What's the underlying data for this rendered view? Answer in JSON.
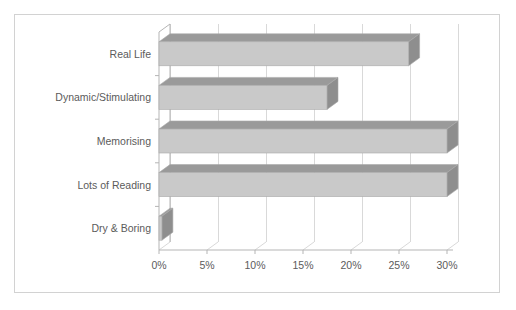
{
  "chart_data": {
    "type": "bar",
    "orientation": "horizontal",
    "style": "3d",
    "title": "",
    "subtitle": "",
    "xlabel": "",
    "ylabel": "",
    "categories": [
      "Dry & Boring",
      "Lots of Reading",
      "Memorising",
      "Dynamic/Stimulating",
      "Real Life"
    ],
    "values": [
      0.3,
      30,
      30,
      17.5,
      26
    ],
    "value_format": "percent",
    "xlim": [
      0,
      30
    ],
    "xticks": [
      0,
      5,
      10,
      15,
      20,
      25,
      30
    ],
    "xtick_labels": [
      "0%",
      "5%",
      "10%",
      "15%",
      "20%",
      "25%",
      "30%"
    ],
    "grid": true,
    "grid_axis": "x",
    "legend": false,
    "legend_position": "none",
    "series": [
      {
        "name": "",
        "values": [
          0.3,
          30,
          30,
          17.5,
          26
        ]
      }
    ]
  },
  "colors": {
    "bar_face": "#c9c9c9",
    "bar_top": "#9a9a9a",
    "bar_side": "#8e8e8e",
    "bar_outline": "#a9a9a9",
    "gridline": "#d9d9d9",
    "axis_line": "#b5b5b5",
    "frame_border": "#d2d2d2",
    "text": "#5b5b5b",
    "plot_background": "#ffffff"
  },
  "axes": {
    "x_axis_labels": [
      "0%",
      "5%",
      "10%",
      "15%",
      "20%",
      "25%",
      "30%"
    ],
    "y_axis_labels": [
      "Real Life",
      "Dynamic/Stimulating",
      "Memorising",
      "Lots of Reading",
      "Dry & Boring"
    ]
  }
}
